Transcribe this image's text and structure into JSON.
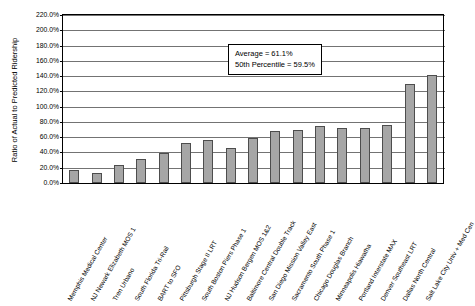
{
  "chart_data": {
    "type": "bar",
    "title": "",
    "xlabel": "",
    "ylabel": "Ratio of Actual to Predicted Ridership",
    "ylim": [
      0,
      220
    ],
    "ytick_labels": [
      "220.0%",
      "200.0%",
      "180.0%",
      "160.0%",
      "140.0%",
      "120.0%",
      "100.0%",
      "80.0%",
      "60.0%",
      "40.0%",
      "20.0%",
      "0.0%"
    ],
    "ytick_values": [
      220,
      200,
      180,
      160,
      140,
      120,
      100,
      80,
      60,
      40,
      20,
      0
    ],
    "grid": true,
    "legend": "none",
    "categories": [
      "Memphis Medical Center",
      "NJ Newark Elizabeth MOS 1",
      "Tren Urbano",
      "South Florida Tri-Rail",
      "BART to SFO",
      "Pittsburgh Stage II LRT",
      "South Boston Piers Phase 1",
      "NJ Hudson Bergen MOS 1&2",
      "Baltimore Central Double Track",
      "San Diego Mission Valley East",
      "Sacramento South Phase 1",
      "Chicago Douglas Branch",
      "Minneapolis Hiawatha",
      "Portland Interstate MAX",
      "Denver Southeast LRT",
      "Dallas North Central",
      "Salt Lake City Univ + Med Cen"
    ],
    "values": [
      17,
      13,
      23,
      31,
      39,
      53,
      56,
      46,
      59,
      68,
      70,
      75,
      72,
      72,
      76,
      130,
      141
    ],
    "annotations": [
      "Average = 61.1%",
      "50th Percentile = 59.5%"
    ],
    "bar_color": "#a6a6a6",
    "bar_border_color": "#4d4d4d",
    "axis_color": "#000000"
  }
}
